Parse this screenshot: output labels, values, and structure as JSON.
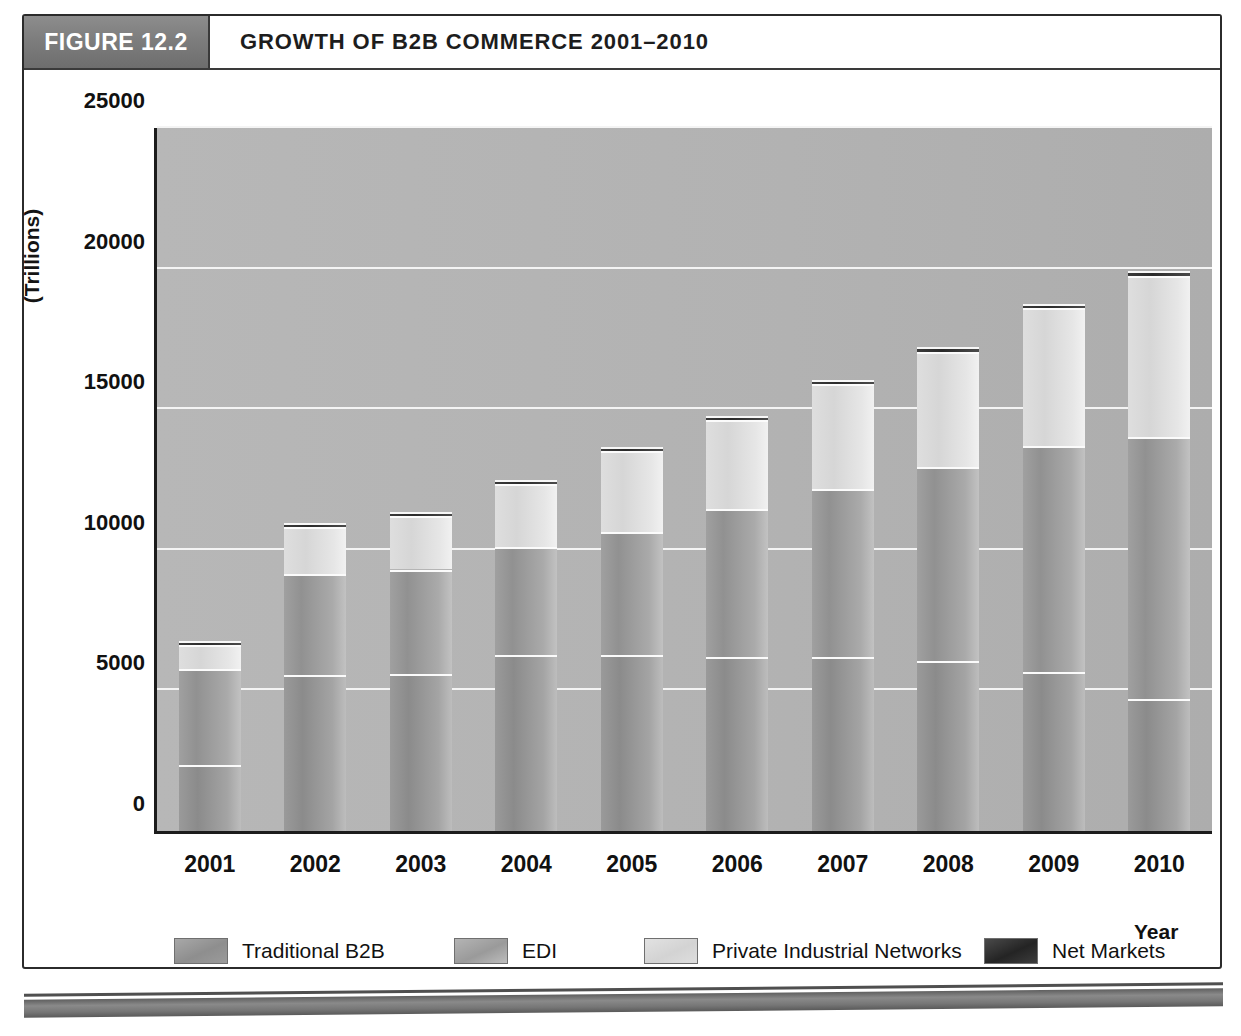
{
  "figure": {
    "tag": "FIGURE 12.2",
    "title": "GROWTH OF B2B COMMERCE 2001–2010"
  },
  "chart_data": {
    "type": "bar",
    "stacked": true,
    "title": "GROWTH OF B2B COMMERCE 2001–2010",
    "xlabel": "Year",
    "ylabel": "(Trillions)",
    "ylim": [
      0,
      25000
    ],
    "yticks": [
      0,
      5000,
      10000,
      15000,
      20000,
      25000
    ],
    "ytick_labels": [
      "0",
      "5000",
      "10000",
      "15000",
      "20000",
      "25000"
    ],
    "grid": true,
    "legend_position": "bottom",
    "categories": [
      "2001",
      "2002",
      "2003",
      "2004",
      "2005",
      "2006",
      "2007",
      "2008",
      "2009",
      "2010"
    ],
    "series": [
      {
        "name": "Traditional B2B",
        "color": "#949494",
        "values": [
          2350,
          5550,
          5600,
          6250,
          6250,
          6200,
          6200,
          6050,
          5650,
          4700
        ]
      },
      {
        "name": "EDI",
        "color": "#9b9b9b",
        "values": [
          3400,
          3600,
          3700,
          3850,
          4400,
          5250,
          5950,
          6900,
          8050,
          9300
        ]
      },
      {
        "name": "Private Industrial Networks",
        "color": "#dcdcdc",
        "values": [
          850,
          1650,
          1900,
          2250,
          2850,
          3150,
          3750,
          4100,
          4900,
          5750
        ]
      },
      {
        "name": "Net Markets",
        "color": "#2f2f2f",
        "values": [
          150,
          150,
          150,
          150,
          150,
          150,
          150,
          150,
          150,
          150
        ]
      }
    ],
    "totals": [
      6750,
      10950,
      11350,
      12500,
      13650,
      14750,
      16050,
      17200,
      18750,
      19900
    ]
  },
  "axis": {
    "y_unit_label": "(Trillions)",
    "x_title": "Year"
  },
  "footer": {
    "rule_color": "#777777"
  }
}
